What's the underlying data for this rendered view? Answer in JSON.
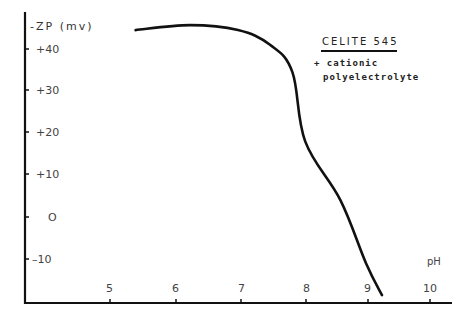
{
  "chart_data": {
    "type": "line",
    "title": "CELITE 545",
    "subtitle": [
      "+ cationic",
      "polyelectrolyte"
    ],
    "xlabel": "pH",
    "ylabel": "-ZP (mv)",
    "x_ticks": [
      "5",
      "6",
      "7",
      "8",
      "9",
      "10"
    ],
    "y_ticks": [
      "+40",
      "+30",
      "+20",
      "+10",
      "0",
      "-10"
    ],
    "xlim": [
      4.0,
      10.3
    ],
    "ylim": [
      -20,
      47
    ],
    "grid": false,
    "legend": "none",
    "series": [
      {
        "name": "CELITE 545 + cationic polyelectrolyte",
        "x": [
          5.4,
          6.25,
          7.0,
          7.5,
          7.85,
          8.05,
          8.6,
          9.0,
          9.25
        ],
        "y": [
          44.5,
          45.7,
          44.5,
          41,
          34.5,
          18,
          4,
          -11,
          -18.6
        ]
      }
    ]
  },
  "labels": {
    "ylabel": "-ZP (mv)",
    "xlabel": "pH",
    "title": "CELITE   545",
    "sub1": "+ cationic",
    "sub2": "polyelectrolyte",
    "y40": "+40",
    "y30": "+30",
    "y20": "+20",
    "y10": "+10",
    "y0": "O",
    "ym10": "–10",
    "x5": "5",
    "x6": "6",
    "x7": "7",
    "x8": "8",
    "x9": "9",
    "x10": "10"
  }
}
